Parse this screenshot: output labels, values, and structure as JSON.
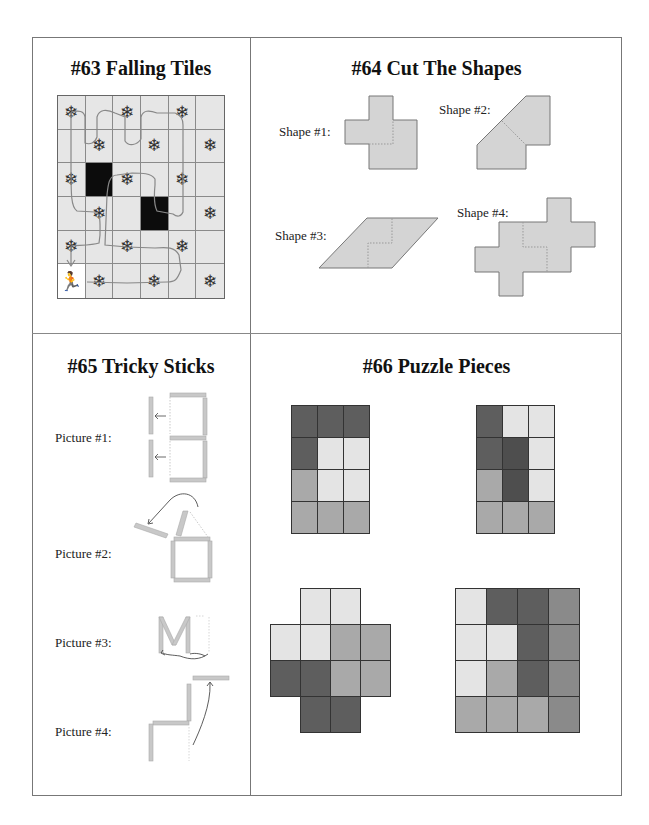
{
  "page": {
    "colors": {
      "frame": "#777777",
      "tile": "#e6e6e6",
      "shape_fill": "#d4d4d4",
      "stick": "#c8c8c8"
    }
  },
  "puzzles": [
    {
      "id": "63",
      "title": "#63 Falling Tiles",
      "grid": {
        "rows": 6,
        "cols": 6,
        "cells": [
          [
            "snowflake",
            "empty",
            "snowflake",
            "empty",
            "snowflake",
            "empty"
          ],
          [
            "empty",
            "snowflake",
            "empty",
            "snowflake",
            "empty",
            "snowflake"
          ],
          [
            "snowflake",
            "black",
            "snowflake",
            "empty",
            "snowflake",
            "empty"
          ],
          [
            "empty",
            "snowflake",
            "empty",
            "black",
            "empty",
            "snowflake"
          ],
          [
            "snowflake",
            "empty",
            "snowflake",
            "empty",
            "snowflake",
            "empty"
          ],
          [
            "runner",
            "snowflake",
            "empty",
            "snowflake",
            "empty",
            "snowflake"
          ]
        ],
        "icons": {
          "snowflake": "❄",
          "runner": "🏃"
        }
      }
    },
    {
      "id": "64",
      "title": "#64 Cut The Shapes",
      "shapes": [
        {
          "label": "Shape #1:"
        },
        {
          "label": "Shape #2:"
        },
        {
          "label": "Shape #3:"
        },
        {
          "label": "Shape #4:"
        }
      ]
    },
    {
      "id": "65",
      "title": "#65 Tricky Sticks",
      "pictures": [
        {
          "label": "Picture #1:"
        },
        {
          "label": "Picture #2:"
        },
        {
          "label": "Picture #3:"
        },
        {
          "label": "Picture #4:"
        }
      ]
    },
    {
      "id": "66",
      "title": "#66 Puzzle Pieces",
      "palette": {
        "L": "#e4e4e4",
        "M": "#a9a9a9",
        "D": "#5e5e5e",
        "X": "#4e4e4e",
        "G": "#8a8a8a",
        "_": "transparent"
      },
      "grids": [
        {
          "cols": 3,
          "rows": [
            "DDD",
            "DLL",
            "MLL",
            "MMM"
          ]
        },
        {
          "cols": 3,
          "rows": [
            "DLL",
            "DXL",
            "MXL",
            "MMM"
          ]
        },
        {
          "cols": 4,
          "rows": [
            "_LL_",
            "LLMM",
            "DDMM",
            "_DD_"
          ]
        },
        {
          "cols": 4,
          "rows": [
            "LDDG",
            "LLDG",
            "LMDG",
            "MMMG"
          ]
        }
      ]
    }
  ]
}
